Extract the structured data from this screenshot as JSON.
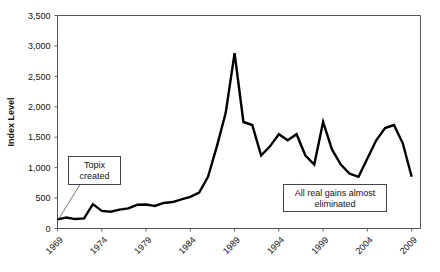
{
  "chart_data": {
    "type": "line",
    "title": "",
    "xlabel": "",
    "ylabel": "Index Level",
    "ylim": [
      0,
      3500
    ],
    "xlim": [
      1969,
      2010
    ],
    "grid": false,
    "legend": false,
    "ytick_labels": [
      "0",
      "500",
      "1,000",
      "1,500",
      "2,000",
      "2,500",
      "3,000",
      "3,500"
    ],
    "ytick_values": [
      0,
      500,
      1000,
      1500,
      2000,
      2500,
      3000,
      3500
    ],
    "xtick_labels": [
      "1969",
      "1974",
      "1979",
      "1984",
      "1989",
      "1994",
      "1999",
      "2004",
      "2009"
    ],
    "xtick_values": [
      1969,
      1974,
      1979,
      1984,
      1989,
      1994,
      1999,
      2004,
      2009
    ],
    "series": [
      {
        "name": "Topix",
        "x": [
          1969,
          1970,
          1971,
          1972,
          1973,
          1974,
          1975,
          1976,
          1977,
          1978,
          1979,
          1980,
          1981,
          1982,
          1983,
          1984,
          1985,
          1986,
          1987,
          1988,
          1989,
          1990,
          1991,
          1992,
          1993,
          1994,
          1995,
          1996,
          1997,
          1998,
          1999,
          2000,
          2001,
          2002,
          2003,
          2004,
          2005,
          2006,
          2007,
          2008,
          2009
        ],
        "values": [
          150,
          180,
          155,
          165,
          400,
          290,
          275,
          310,
          330,
          390,
          395,
          370,
          420,
          435,
          480,
          520,
          590,
          850,
          1350,
          1900,
          2880,
          1750,
          1700,
          1200,
          1350,
          1550,
          1450,
          1550,
          1200,
          1050,
          1750,
          1300,
          1050,
          900,
          850,
          1150,
          1450,
          1650,
          1700,
          1400,
          850
        ]
      }
    ],
    "annotations": [
      {
        "id": "topix-created",
        "text_line1": "Topix",
        "text_line2": "created",
        "points_to_year": 1969,
        "points_to_value": 150
      },
      {
        "id": "gains-eliminated",
        "text_line1": "All real gains almost",
        "text_line2": "eliminated",
        "points_to_year": 2003,
        "points_to_value": 850
      }
    ]
  },
  "axis": {
    "y_title": "Index Level"
  }
}
